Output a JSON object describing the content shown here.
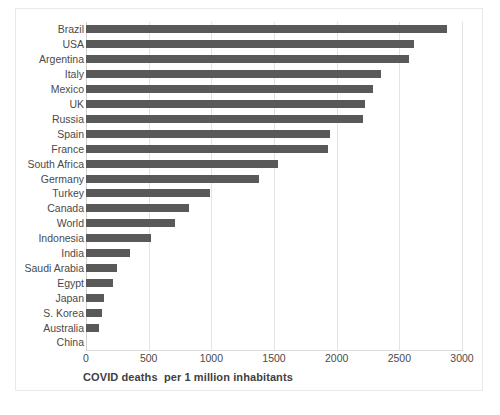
{
  "chart_data": {
    "type": "bar",
    "orientation": "horizontal",
    "title": "",
    "subtitle": "",
    "xlabel": "COVID deaths  per 1 million inhabitants",
    "ylabel": "",
    "xlim": [
      0,
      3000
    ],
    "xticks": [
      0,
      500,
      1000,
      1500,
      2000,
      2500,
      3000
    ],
    "xtick_labels": [
      "0",
      "500",
      "1000",
      "1500",
      "2000",
      "2500",
      "3000"
    ],
    "grid": true,
    "grid_axis": "x",
    "legend": false,
    "legend_position": "none",
    "bar_color": "#595959",
    "gridline_color": "#e3e3e3",
    "categories": [
      "Brazil",
      "USA",
      "Argentina",
      "Italy",
      "Mexico",
      "UK",
      "Russia",
      "Spain",
      "France",
      "South Africa",
      "Germany",
      "Turkey",
      "Canada",
      "World",
      "Indonesia",
      "India",
      "Saudi Arabia",
      "Egypt",
      "Japan",
      "S. Korea",
      "Australia",
      "China"
    ],
    "values": [
      2880,
      2620,
      2580,
      2350,
      2290,
      2230,
      2210,
      1950,
      1930,
      1530,
      1380,
      990,
      820,
      710,
      520,
      350,
      250,
      215,
      145,
      125,
      100,
      0
    ]
  }
}
